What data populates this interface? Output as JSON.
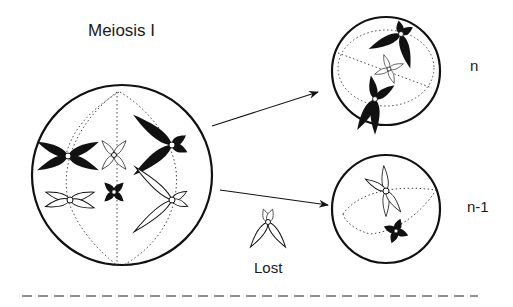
{
  "diagram": {
    "title": "Meiosis I",
    "labels": {
      "top_daughter": "n",
      "bottom_daughter": "n-1",
      "lost": "Lost"
    },
    "colors": {
      "stroke": "#111111",
      "background": "#ffffff"
    },
    "cells": [
      {
        "id": "parent",
        "cx": 122,
        "cy": 175,
        "r": 90
      },
      {
        "id": "daughter_n",
        "cx": 386,
        "cy": 71,
        "r": 54
      },
      {
        "id": "daughter_n_minus_1",
        "cx": 386,
        "cy": 209,
        "r": 54
      }
    ],
    "arrows": [
      {
        "from": [
          212,
          126
        ],
        "to": [
          318,
          92
        ]
      },
      {
        "from": [
          220,
          190
        ],
        "to": [
          328,
          205
        ]
      }
    ]
  }
}
